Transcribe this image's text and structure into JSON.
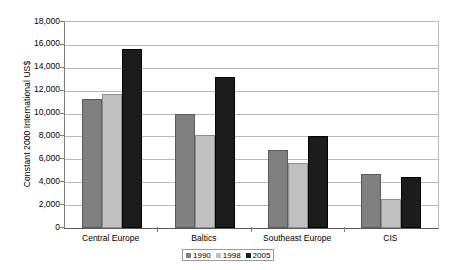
{
  "chart_data": {
    "type": "bar",
    "title": "",
    "subtitle": "",
    "xlabel": "",
    "ylabel": "Constant 2000 International US$",
    "ylim": [
      0,
      18000
    ],
    "ytick_step": 2000,
    "ytick_labels": [
      "0",
      "2,000",
      "4,000",
      "6,000",
      "8,000",
      "10,000",
      "12,000",
      "14,000",
      "16,000",
      "18,000"
    ],
    "ytick_values": [
      0,
      2000,
      4000,
      6000,
      8000,
      10000,
      12000,
      14000,
      16000,
      18000
    ],
    "grid": true,
    "grid_axis": "y",
    "legend_position": "bottom-center",
    "categories": [
      "Central Europe",
      "Baltics",
      "Southeast Europe",
      "CIS"
    ],
    "series": [
      {
        "name": "1990",
        "color": "#808080",
        "values": [
          11250,
          10000,
          6800,
          4750
        ]
      },
      {
        "name": "1998",
        "color": "#c0c0c0",
        "values": [
          11700,
          8100,
          5700,
          2550
        ]
      },
      {
        "name": "2005",
        "color": "#1c1c1c",
        "values": [
          15600,
          13200,
          8000,
          4500
        ]
      }
    ]
  },
  "legend": {
    "items": [
      {
        "label": "1990"
      },
      {
        "label": "1998"
      },
      {
        "label": "2005"
      }
    ]
  },
  "axes": {
    "y_title": "Constant 2000 International US$"
  },
  "colors": {
    "series_1990": "#808080",
    "series_1998": "#c0c0c0",
    "series_2005": "#1c1c1c",
    "gridline": "#b8b8b8",
    "axis": "#808080",
    "background": "#ffffff"
  }
}
